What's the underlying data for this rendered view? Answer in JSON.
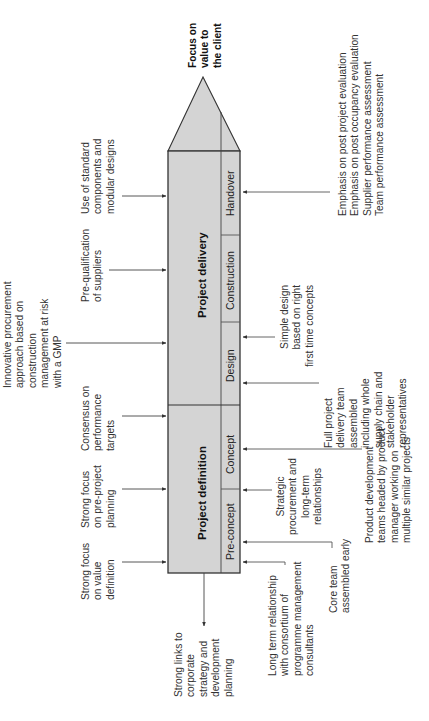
{
  "diagram": {
    "goal": "Focus on\nvalue to\nthe client",
    "phases": [
      {
        "label": "Project definition"
      },
      {
        "label": "Project delivery"
      }
    ],
    "stages": [
      {
        "label": "Pre-concept"
      },
      {
        "label": "Concept"
      },
      {
        "label": "Design"
      },
      {
        "label": "Construction"
      },
      {
        "label": "Handover"
      }
    ],
    "inputs_top": [
      {
        "text": "Strong focus\non value\ndefinition"
      },
      {
        "text": "Strong focus\non pre-project\nplanning"
      },
      {
        "text": "Consensus on\nperformance\ntargets"
      },
      {
        "text": "Innovative procurement\napproach based on\nconstruction\nmanagement at risk\nwith a GMP"
      },
      {
        "text": "Pre-qualification\nof suppliers"
      },
      {
        "text": "Use of standard\ncomponents and\nmodular designs"
      }
    ],
    "output_left": {
      "text": "Strong links to\ncorporate\nstrategy and\ndevelopment\nplanning"
    },
    "inputs_bottom": [
      {
        "text": "Long term relationship\nwith consortium of\nprogramme management\nconsultants"
      },
      {
        "text": "Core team\nassembled early"
      },
      {
        "text": "Strategic\nprocurement and\nlong-term\nrelationships"
      },
      {
        "text": "Product development\nteams headed by product\nmanager working on\nmultiple similar projects"
      },
      {
        "text": "Full project\ndelivery team\nassembled\nincluding whole\nsupply chain and\nstakeholder\nrepresentatives"
      },
      {
        "text": "Simple design\nbased on right\nfirst time concepts"
      },
      {
        "text": "Emphasis on post project evaluation\nEmphasis on post occupancy evaluation\nSupplier performance assessment\nTeam performance assessment"
      }
    ],
    "colors": {
      "fill": "#d4d4d4",
      "stroke": "#333333",
      "arrow": "#444444",
      "text": "#333333"
    }
  }
}
